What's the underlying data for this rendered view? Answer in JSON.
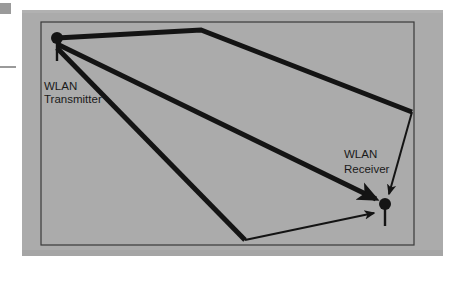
{
  "figure": {
    "type": "multipath-propagation-diagram",
    "title_visible": false,
    "background_color": "#ffffff",
    "panel_color": "#ababab",
    "ink_color": "#141414",
    "room_border_color": "#3a3a3a"
  },
  "panel": {
    "x": 22,
    "y": 10,
    "width": 421,
    "height": 246
  },
  "room": {
    "x": 41,
    "y": 22,
    "width": 373,
    "height": 223,
    "stroke_width": 1.2
  },
  "margin_marks": [
    {
      "name": "top-mark",
      "x": 0,
      "y": 3,
      "width": 11,
      "height": 11,
      "color": "#9a9a9a"
    },
    {
      "name": "rule-mark",
      "x": 0,
      "y": 66,
      "width": 16,
      "height": 2,
      "color": "#9a9a9a"
    }
  ],
  "nodes": [
    {
      "id": "transmitter",
      "label_line1": "WLAN",
      "label_line2": "Transmitter",
      "dot_x": 57,
      "dot_y": 38,
      "dot_r": 6,
      "antenna_x1": 57,
      "antenna_y1": 38,
      "antenna_x2": 57,
      "antenna_y2": 61,
      "label_x": 44,
      "label_y1": 90,
      "label_y2": 103,
      "label_anchor": "start"
    },
    {
      "id": "receiver",
      "label_line1": "WLAN",
      "label_line2": "Receiver",
      "dot_x": 385,
      "dot_y": 204,
      "dot_r": 6,
      "antenna_x1": 385,
      "antenna_y1": 204,
      "antenna_x2": 385,
      "antenna_y2": 226,
      "label_x": 344,
      "label_y1": 158,
      "label_y2": 173,
      "label_anchor": "start"
    }
  ],
  "paths": [
    {
      "id": "ceiling-reflected-path",
      "name": "ceiling reflected ray",
      "stroke_width": 5,
      "arrow": false,
      "points": "57,38 201,30 412,112"
    },
    {
      "id": "ceiling-reflected-arrival",
      "name": "ceiling reflected arrival at receiver",
      "stroke_width": 2,
      "arrow": true,
      "points": "412,112 388,196"
    },
    {
      "id": "direct-path",
      "name": "direct line of sight ray",
      "stroke_width": 5,
      "arrow": true,
      "points": "57,44 378,200"
    },
    {
      "id": "floor-reflected-path",
      "name": "floor reflected ray",
      "stroke_width": 5,
      "arrow": false,
      "points": "57,48 245,240"
    },
    {
      "id": "floor-reflected-arrival",
      "name": "floor reflected arrival at receiver",
      "stroke_width": 2,
      "arrow": true,
      "points": "245,240 377,212"
    }
  ]
}
